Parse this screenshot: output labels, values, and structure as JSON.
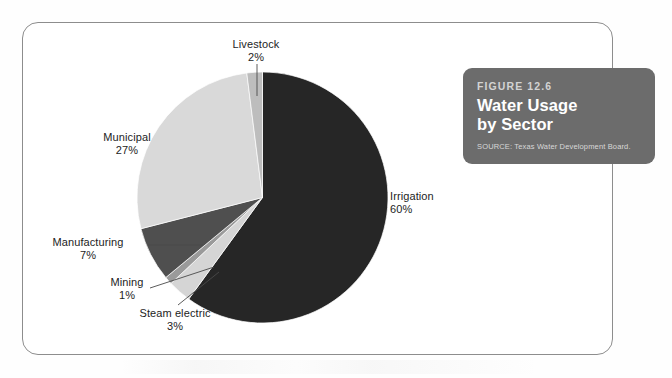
{
  "figure": {
    "number_label": "FIGURE 12.6",
    "title_line1": "Water Usage",
    "title_line2": "by Sector",
    "source": "SOURCE: Texas Water Development Board.",
    "box_color": "#6c6c6c",
    "frame_color": "#8d8d8d"
  },
  "chart_data": {
    "type": "pie",
    "title": "Water Usage by Sector",
    "subtitle": "FIGURE 12.6",
    "source": "SOURCE: Texas Water Development Board.",
    "unit": "%",
    "start_angle_deg": 0,
    "direction": "clockwise",
    "legend": "none-labels-outside",
    "categories": [
      "Irrigation",
      "Steam electric",
      "Mining",
      "Manufacturing",
      "Municipal",
      "Livestock"
    ],
    "values": [
      60,
      3,
      1,
      7,
      27,
      2
    ],
    "colors": [
      "#262626",
      "#d5d5d5",
      "#9a9a9a",
      "#4f4f4f",
      "#d9d9d9",
      "#bdbdbd"
    ],
    "slices": [
      {
        "name": "Irrigation",
        "value": 60,
        "label": "Irrigation",
        "value_label": "60%",
        "color": "#262626"
      },
      {
        "name": "Steam electric",
        "value": 3,
        "label": "Steam electric",
        "value_label": "3%",
        "color": "#d5d5d5"
      },
      {
        "name": "Mining",
        "value": 1,
        "label": "Mining",
        "value_label": "1%",
        "color": "#9a9a9a"
      },
      {
        "name": "Manufacturing",
        "value": 7,
        "label": "Manufacturing",
        "value_label": "7%",
        "color": "#4f4f4f"
      },
      {
        "name": "Municipal",
        "value": 27,
        "label": "Municipal",
        "value_label": "27%",
        "color": "#d9d9d9"
      },
      {
        "name": "Livestock",
        "value": 2,
        "label": "Livestock",
        "value_label": "2%",
        "color": "#bdbdbd"
      }
    ]
  }
}
